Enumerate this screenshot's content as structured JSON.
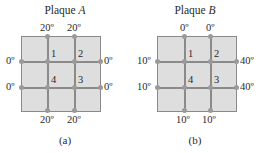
{
  "plates": [
    {
      "title_prefix": "Plaque ",
      "title_letter": "A",
      "caption": "(a)",
      "top": [
        "20º",
        "20º"
      ],
      "bottom": [
        "20º",
        "20º"
      ],
      "left": [
        "0º",
        "0º"
      ],
      "right": [
        "0º",
        "0º"
      ],
      "nodes": [
        "1",
        "2",
        "3",
        "4"
      ]
    },
    {
      "title_prefix": "Plaque ",
      "title_letter": "B",
      "caption": "(b)",
      "top": [
        "0º",
        "0º"
      ],
      "bottom": [
        "10º",
        "10º"
      ],
      "left": [
        "10º",
        "10º"
      ],
      "right": [
        "40º",
        "40º"
      ],
      "nodes": [
        "1",
        "2",
        "3",
        "4"
      ]
    }
  ],
  "colors": {
    "plate_fill": "#dedede",
    "grid": "#8a8a8a"
  }
}
